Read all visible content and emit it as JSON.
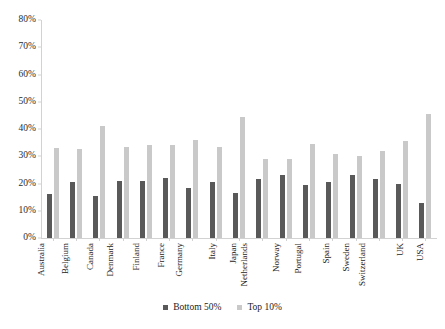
{
  "chart_data": {
    "type": "bar",
    "title": "",
    "subtitle": "",
    "xlabel": "",
    "ylabel": "",
    "ylim": [
      0,
      80
    ],
    "ytick_labels": [
      "0%",
      "10%",
      "20%",
      "30%",
      "40%",
      "50%",
      "60%",
      "70%",
      "80%"
    ],
    "ytick_values": [
      0,
      10,
      20,
      30,
      40,
      50,
      60,
      70,
      80
    ],
    "grid": false,
    "legend_position": "bottom",
    "categories": [
      "Australia",
      "Belgium",
      "Canada",
      "Denmark",
      "Finland",
      "France",
      "Germany",
      "Italy",
      "Japan",
      "Netherlands",
      "Norway",
      "Portugal",
      "Spain",
      "Sweden",
      "Switzerland",
      "UK",
      "USA"
    ],
    "series": [
      {
        "name": "Bottom 50%",
        "color": "#595959",
        "values": [
          16,
          20.5,
          15.5,
          21,
          21,
          22,
          18.5,
          20.5,
          16.5,
          21.5,
          23,
          19.5,
          20.5,
          23,
          21.5,
          20,
          13
        ]
      },
      {
        "name": "Top 10%",
        "color": "#c9c9c9",
        "values": [
          33,
          32.5,
          41,
          33.5,
          34,
          34,
          36,
          33.5,
          44.5,
          29,
          29,
          34.5,
          31,
          30,
          32,
          35.5,
          45.5
        ]
      }
    ]
  },
  "legend": {
    "items": [
      {
        "label": "Bottom 50%"
      },
      {
        "label": "Top 10%"
      }
    ]
  },
  "colors": {
    "bottom50": "#595959",
    "top10": "#c9c9c9",
    "axis": "#d2d2d2",
    "text": "#1c1c1c",
    "background": "#ffffff"
  }
}
